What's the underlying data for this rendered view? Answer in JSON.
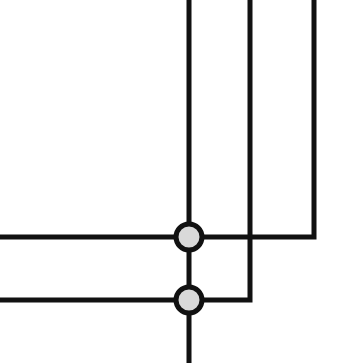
{
  "diagram": {
    "type": "wiring-junction-diagram",
    "background": "#ffffff",
    "wire_color": "#111111",
    "node_fill": "#d9d9d9",
    "wire_width": 5,
    "wires": [
      {
        "id": "wire-a",
        "points": [
          [
            189,
            0
          ],
          [
            189,
            363
          ]
        ]
      },
      {
        "id": "wire-b",
        "points": [
          [
            250,
            0
          ],
          [
            250,
            300
          ],
          [
            0,
            300
          ]
        ]
      },
      {
        "id": "wire-c",
        "points": [
          [
            314,
            0
          ],
          [
            314,
            237
          ],
          [
            0,
            237
          ]
        ]
      }
    ],
    "junctions": [
      {
        "id": "junction-top",
        "cx": 189,
        "cy": 237,
        "r": 13
      },
      {
        "id": "junction-bottom",
        "cx": 189,
        "cy": 300,
        "r": 13
      }
    ],
    "crossings": [
      {
        "id": "crossover-b-c",
        "x": 250,
        "y": 237,
        "connected": false
      }
    ]
  }
}
